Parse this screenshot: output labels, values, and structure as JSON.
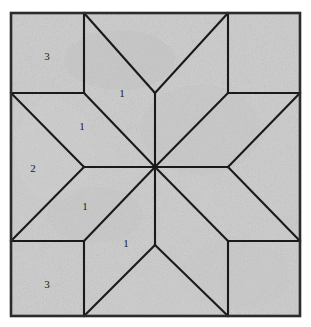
{
  "figure": {
    "kind": "quilt-block-pattern-diagram",
    "background_color": "#ffffff",
    "fabric_color": "#c9c9c9",
    "fabric_color_dark": "#b6b6b6",
    "fabric_color_light": "#d8d8d8",
    "line_color": "#1a1a1a",
    "border_color": "#2b2b2b",
    "label_color": "#1a1a1a",
    "frame": {
      "x": 11,
      "y": 13,
      "width": 289,
      "height": 303
    },
    "center": {
      "x": 155,
      "y": 167
    }
  },
  "piece_labels": [
    {
      "id": "label-3-top-left",
      "text": "3",
      "x": 47,
      "y": 57,
      "piece": "corner-square"
    },
    {
      "id": "label-1-top",
      "text": "1",
      "x": 122,
      "y": 94,
      "piece": "star-diamond"
    },
    {
      "id": "label-1-upper-left",
      "text": "1",
      "x": 82,
      "y": 127,
      "piece": "star-diamond"
    },
    {
      "id": "label-2-left",
      "text": "2",
      "x": 33,
      "y": 169,
      "piece": "side-triangle"
    },
    {
      "id": "label-1-lower-left",
      "text": "1",
      "x": 85,
      "y": 207,
      "piece": "star-diamond"
    },
    {
      "id": "label-1-bottom",
      "text": "1",
      "x": 126,
      "y": 244,
      "piece": "star-diamond"
    },
    {
      "id": "label-3-bottom-left",
      "text": "3",
      "x": 47,
      "y": 285,
      "piece": "corner-square"
    }
  ],
  "shapes": {
    "corner_squares": [
      {
        "id": "corner-square-top-left",
        "points": "11,13 84,13 84,93 11,93"
      },
      {
        "id": "corner-square-top-right",
        "points": "228,13 300,13 300,93 228,93"
      },
      {
        "id": "corner-square-bottom-left",
        "points": "11,241 84,241 84,316 11,316"
      },
      {
        "id": "corner-square-bottom-right",
        "points": "228,241 300,241 300,316 228,316"
      }
    ],
    "side_triangles": [
      {
        "id": "side-triangle-top",
        "points": "84,13 228,13 155,93"
      },
      {
        "id": "side-triangle-left",
        "points": "11,93 84,167 11,241"
      },
      {
        "id": "side-triangle-right",
        "points": "300,93 228,167 300,241"
      },
      {
        "id": "side-triangle-bottom",
        "points": "84,316 155,245 228,316"
      }
    ],
    "star_diamonds": [
      {
        "id": "star-diamond-n",
        "points": "155,93 84,93 155,167 228,93"
      },
      {
        "id": "star-diamond-nw",
        "points": "84,93 11,93 84,167 155,167"
      },
      {
        "id": "star-diamond-sw",
        "points": "84,167 11,241 84,241 155,167"
      },
      {
        "id": "star-diamond-s",
        "points": "84,241 155,245 228,241 155,167"
      },
      {
        "id": "star-diamond-ne",
        "points": "228,93 300,93 228,167 155,167"
      },
      {
        "id": "star-diamond-se",
        "points": "228,167 300,241 228,241 155,167"
      }
    ],
    "seam_lines": [
      {
        "id": "seam-top-left-vertical",
        "x1": 84,
        "y1": 13,
        "x2": 84,
        "y2": 93
      },
      {
        "id": "seam-top-right-vertical",
        "x1": 228,
        "y1": 13,
        "x2": 228,
        "y2": 93
      },
      {
        "id": "seam-bottom-left-vertical",
        "x1": 84,
        "y1": 241,
        "x2": 84,
        "y2": 316
      },
      {
        "id": "seam-bottom-right-vertical",
        "x1": 228,
        "y1": 241,
        "x2": 228,
        "y2": 316
      },
      {
        "id": "seam-left-upper-horizontal",
        "x1": 11,
        "y1": 93,
        "x2": 84,
        "y2": 93
      },
      {
        "id": "seam-right-upper-horizontal",
        "x1": 228,
        "y1": 93,
        "x2": 300,
        "y2": 93
      },
      {
        "id": "seam-left-lower-horizontal",
        "x1": 11,
        "y1": 241,
        "x2": 84,
        "y2": 241
      },
      {
        "id": "seam-right-lower-horizontal",
        "x1": 228,
        "y1": 241,
        "x2": 300,
        "y2": 241
      },
      {
        "id": "seam-center-horizontal",
        "x1": 84,
        "y1": 167,
        "x2": 228,
        "y2": 167
      },
      {
        "id": "seam-center-vertical-top",
        "x1": 155,
        "y1": 93,
        "x2": 155,
        "y2": 167
      },
      {
        "id": "seam-center-vertical-bottom",
        "x1": 155,
        "y1": 167,
        "x2": 155,
        "y2": 245
      },
      {
        "id": "seam-diag-nw-tip",
        "x1": 84,
        "y1": 13,
        "x2": 155,
        "y2": 93
      },
      {
        "id": "seam-diag-ne-tip",
        "x1": 228,
        "y1": 13,
        "x2": 155,
        "y2": 93
      },
      {
        "id": "seam-diag-sw-tip",
        "x1": 84,
        "y1": 316,
        "x2": 155,
        "y2": 245
      },
      {
        "id": "seam-diag-se-tip",
        "x1": 228,
        "y1": 316,
        "x2": 155,
        "y2": 245
      },
      {
        "id": "seam-diag-nw-inner",
        "x1": 11,
        "y1": 93,
        "x2": 84,
        "y2": 167
      },
      {
        "id": "seam-diag-sw-inner",
        "x1": 11,
        "y1": 241,
        "x2": 84,
        "y2": 167
      },
      {
        "id": "seam-diag-ne-inner",
        "x1": 300,
        "y1": 93,
        "x2": 228,
        "y2": 167
      },
      {
        "id": "seam-diag-se-inner",
        "x1": 300,
        "y1": 241,
        "x2": 228,
        "y2": 167
      },
      {
        "id": "seam-diag-main-nw",
        "x1": 84,
        "y1": 93,
        "x2": 155,
        "y2": 167
      },
      {
        "id": "seam-diag-main-ne",
        "x1": 228,
        "y1": 93,
        "x2": 155,
        "y2": 167
      },
      {
        "id": "seam-diag-main-sw",
        "x1": 84,
        "y1": 241,
        "x2": 155,
        "y2": 167
      },
      {
        "id": "seam-diag-main-se",
        "x1": 228,
        "y1": 241,
        "x2": 155,
        "y2": 167
      }
    ]
  }
}
